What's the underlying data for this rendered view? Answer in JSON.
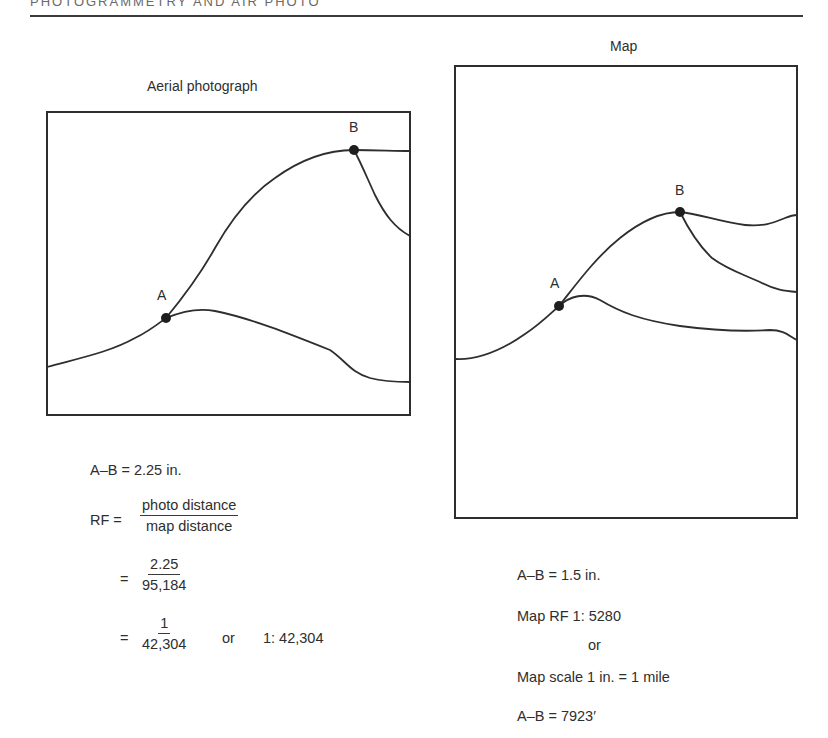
{
  "header": {
    "running_title": "PHOTOGRAMMETRY AND AIR PHOTO"
  },
  "photo_panel": {
    "title": "Aerial photograph",
    "point_a_label": "A",
    "point_b_label": "B",
    "calc": {
      "ab_distance": "A–B = 2.25 in.",
      "rf_label": "RF =",
      "rf_num": "photo distance",
      "rf_den": "map distance",
      "eq1": "=",
      "step1_num": "2.25",
      "step1_den": "95,184",
      "eq2": "=",
      "step2_num": "1",
      "step2_den": "42,304",
      "or_text": "or",
      "ratio": "1: 42,304"
    }
  },
  "map_panel": {
    "title": "Map",
    "point_a_label": "A",
    "point_b_label": "B",
    "calc": {
      "ab_distance": "A–B = 1.5 in.",
      "map_rf": "Map RF    1: 5280",
      "or_text": "or",
      "map_scale": "Map scale  1 in. = 1 mile",
      "ab_ground": "A–B = 7923′"
    }
  },
  "colors": {
    "ink": "#2e2e2e",
    "paper": "#ffffff"
  }
}
